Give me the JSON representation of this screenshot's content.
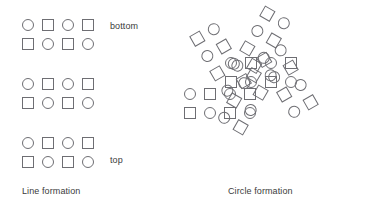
{
  "figure": {
    "title": "",
    "background_color": "#ffffff",
    "width": 375,
    "height": 221,
    "shape_stroke_color": "#6e6e73",
    "text_color": "#3b3b3b"
  },
  "panels": [
    {
      "id": "line-formation",
      "caption": "Line formation",
      "caption_pos": {
        "x": 22,
        "y": 186
      },
      "labels": [
        {
          "id": "bottom",
          "text": "bottom",
          "x": 110,
          "y": 21
        },
        {
          "id": "top",
          "text": "top",
          "x": 110,
          "y": 155
        }
      ],
      "groups": [
        {
          "id": "line-group-1",
          "origin": {
            "x": 22,
            "y": 19
          },
          "rotation_deg": 0,
          "rows": [
            [
              "circle",
              "square",
              "circle",
              "square"
            ],
            [
              "square",
              "circle",
              "square",
              "circle"
            ]
          ]
        },
        {
          "id": "line-group-2",
          "origin": {
            "x": 22,
            "y": 78
          },
          "rotation_deg": 0,
          "rows": [
            [
              "circle",
              "square",
              "circle",
              "square"
            ],
            [
              "square",
              "circle",
              "square",
              "circle"
            ]
          ]
        },
        {
          "id": "line-group-3",
          "origin": {
            "x": 22,
            "y": 137
          },
          "rotation_deg": 0,
          "rows": [
            [
              "circle",
              "square",
              "circle",
              "square"
            ],
            [
              "square",
              "circle",
              "square",
              "circle"
            ]
          ]
        }
      ]
    },
    {
      "id": "circle-formation",
      "caption": "Circle formation",
      "caption_pos": {
        "x": 228,
        "y": 186
      },
      "labels": [],
      "center": {
        "x": 270,
        "y": 100
      },
      "arm_count": 6,
      "groups": [
        {
          "id": "circle-arm-left",
          "origin": {
            "x": 184,
            "y": 88
          },
          "rotation_deg": 0,
          "rows": [
            [
              "circle",
              "square",
              "circle",
              "square"
            ],
            [
              "square",
              "circle",
              "square",
              "circle"
            ]
          ]
        },
        {
          "id": "circle-arm-upper-left",
          "origin": {
            "x": 216,
            "y": 21
          },
          "rotation_deg": 60,
          "rows": [
            [
              "circle",
              "square",
              "circle",
              "square"
            ],
            [
              "square",
              "circle",
              "square",
              "circle"
            ]
          ]
        },
        {
          "id": "circle-arm-upper-right",
          "origin": {
            "x": 292,
            "y": 21
          },
          "rotation_deg": 120,
          "rows": [
            [
              "circle",
              "square",
              "circle",
              "square"
            ],
            [
              "square",
              "circle",
              "square",
              "circle"
            ]
          ]
        },
        {
          "id": "circle-arm-right",
          "origin": {
            "x": 297,
            "y": 88
          },
          "rotation_deg": 180,
          "rows": [
            [
              "circle",
              "square",
              "circle",
              "square"
            ],
            [
              "square",
              "circle",
              "square",
              "circle"
            ]
          ]
        },
        {
          "id": "circle-arm-lower-right",
          "origin": {
            "x": 292,
            "y": 120
          },
          "rotation_deg": 240,
          "rows": [
            [
              "circle",
              "square",
              "circle",
              "square"
            ],
            [
              "square",
              "circle",
              "square",
              "circle"
            ]
          ]
        },
        {
          "id": "circle-arm-lower-left",
          "origin": {
            "x": 216,
            "y": 120
          },
          "rotation_deg": 300,
          "rows": [
            [
              "circle",
              "square",
              "circle",
              "square"
            ],
            [
              "square",
              "circle",
              "square",
              "circle"
            ]
          ]
        }
      ]
    }
  ],
  "geometry": {
    "cell_w": 20,
    "cell_h": 19,
    "shape_size": 12,
    "circle_size": 12
  }
}
